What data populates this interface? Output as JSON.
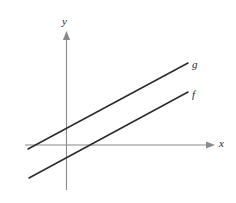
{
  "figure": {
    "name": "two-parallel-lines-graph",
    "background_color": "#ffffff",
    "width": 236,
    "height": 203
  },
  "axes": {
    "x_axis": {
      "label": "x",
      "label_x": 219,
      "label_y": 147,
      "color": "#8a8a8a",
      "stroke_width": 1.1,
      "x1": 25,
      "y1": 145,
      "x2": 209,
      "y2": 145,
      "arrow_tip_x": 215,
      "arrow_tip_y": 145,
      "arrow_points": "206,141.4 215,145 206,148.6"
    },
    "y_axis": {
      "label": "y",
      "label_x": 62,
      "label_y": 25,
      "color": "#8a8a8a",
      "stroke_width": 1.1,
      "x1": 66.5,
      "y1": 38,
      "x2": 66.5,
      "y2": 190,
      "arrow_tip_x": 66.5,
      "arrow_tip_y": 31,
      "arrow_points": "62.9,40 66.5,31 70.1,40"
    }
  },
  "chart_data": {
    "type": "line",
    "title": "",
    "xlabel": "x",
    "ylabel": "y",
    "grid": false,
    "legend": "inline-end-labels",
    "axis_origin_px": {
      "x": 66.5,
      "y": 145
    },
    "series": [
      {
        "name": "g",
        "label": "g",
        "label_x": 192,
        "label_y": 68,
        "color": "#2b2b2b",
        "stroke_width": 1.5,
        "x1": 28,
        "y1": 149,
        "x2": 188,
        "y2": 63,
        "y_intercept_px": 130.3,
        "x_intercept_px": 25.0,
        "slope_screen": -0.5375,
        "description": "upper line, crosses y-axis above origin"
      },
      {
        "name": "f",
        "label": "f",
        "label_x": 192,
        "label_y": 98,
        "color": "#2b2b2b",
        "stroke_width": 1.5,
        "x1": 29,
        "y1": 178,
        "x2": 188,
        "y2": 92,
        "y_intercept_px": 157.7,
        "x_intercept_px": 92.3,
        "slope_screen": -0.5409,
        "description": "lower line, parallel to g, crosses x-axis right of origin"
      }
    ]
  }
}
